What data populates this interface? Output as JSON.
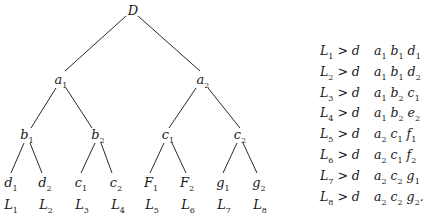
{
  "tree": {
    "root": {
      "label": "D"
    },
    "level1": [
      {
        "base": "a",
        "sub": "1"
      },
      {
        "base": "a",
        "sub": "2"
      }
    ],
    "level2": [
      {
        "base": "b",
        "sub": "1"
      },
      {
        "base": "b",
        "sub": "2"
      },
      {
        "base": "c",
        "sub": "1"
      },
      {
        "base": "c",
        "sub": "2"
      }
    ],
    "leaves": [
      {
        "base": "d",
        "sub": "1"
      },
      {
        "base": "d",
        "sub": "2"
      },
      {
        "base": "c",
        "sub": "1"
      },
      {
        "base": "c",
        "sub": "2"
      },
      {
        "base": "F",
        "sub": "1"
      },
      {
        "base": "F",
        "sub": "2"
      },
      {
        "base": "g",
        "sub": "1"
      },
      {
        "base": "g",
        "sub": "2"
      }
    ],
    "leaf_labels": [
      {
        "base": "L",
        "sub": "1"
      },
      {
        "base": "L",
        "sub": "2"
      },
      {
        "base": "L",
        "sub": "3"
      },
      {
        "base": "L",
        "sub": "4"
      },
      {
        "base": "L",
        "sub": "5"
      },
      {
        "base": "L",
        "sub": "6"
      },
      {
        "base": "L",
        "sub": "7"
      },
      {
        "base": "L",
        "sub": "8"
      }
    ]
  },
  "rules": [
    {
      "L": "1",
      "rel": "> d",
      "path": [
        {
          "b": "a",
          "s": "1"
        },
        {
          "b": "b",
          "s": "1"
        },
        {
          "b": "d",
          "s": "1"
        }
      ],
      "end": ""
    },
    {
      "L": "2",
      "rel": "> d",
      "path": [
        {
          "b": "a",
          "s": "1"
        },
        {
          "b": "b",
          "s": "1"
        },
        {
          "b": "d",
          "s": "2"
        }
      ],
      "end": ""
    },
    {
      "L": "3",
      "rel": "> d",
      "path": [
        {
          "b": "a",
          "s": "1"
        },
        {
          "b": "b",
          "s": "2"
        },
        {
          "b": "c",
          "s": "1"
        }
      ],
      "end": ""
    },
    {
      "L": "4",
      "rel": "> d",
      "path": [
        {
          "b": "a",
          "s": "1"
        },
        {
          "b": "b",
          "s": "2"
        },
        {
          "b": "e",
          "s": "2"
        }
      ],
      "end": ""
    },
    {
      "L": "5",
      "rel": "> d",
      "path": [
        {
          "b": "a",
          "s": "2"
        },
        {
          "b": "c",
          "s": "1"
        },
        {
          "b": "f",
          "s": "1"
        }
      ],
      "end": ""
    },
    {
      "L": "6",
      "rel": "> d",
      "path": [
        {
          "b": "a",
          "s": "2"
        },
        {
          "b": "c",
          "s": "1"
        },
        {
          "b": "f",
          "s": "2"
        }
      ],
      "end": ""
    },
    {
      "L": "7",
      "rel": "> d",
      "path": [
        {
          "b": "a",
          "s": "2"
        },
        {
          "b": "c",
          "s": "2"
        },
        {
          "b": "g",
          "s": "1"
        }
      ],
      "end": ""
    },
    {
      "L": "8",
      "rel": "> d",
      "path": [
        {
          "b": "a",
          "s": "2"
        },
        {
          "b": "c",
          "s": "2"
        },
        {
          "b": "g",
          "s": "2"
        }
      ],
      "end": "."
    }
  ]
}
